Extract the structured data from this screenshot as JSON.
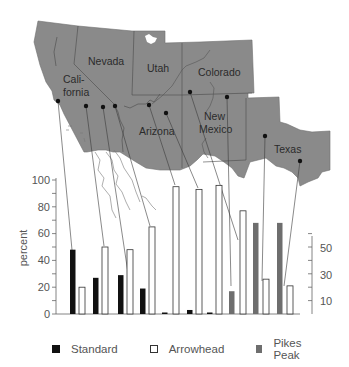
{
  "map": {
    "states": [
      {
        "name": "Nevada",
        "label": "Nevada",
        "x": 99,
        "y": 65
      },
      {
        "name": "Utah",
        "label": "Utah",
        "x": 147,
        "y": 72
      },
      {
        "name": "Colorado",
        "label": "Colorado",
        "x": 198,
        "y": 76
      },
      {
        "name": "California",
        "label_line1": "Cali-",
        "label_line2": "fornia",
        "x": 64,
        "y": 83
      },
      {
        "name": "Arizona",
        "label": "Arizona",
        "x": 139,
        "y": 135
      },
      {
        "name": "New Mexico",
        "label_line1": "New",
        "label_line2": "Mexico",
        "x": 199,
        "y": 119
      },
      {
        "name": "Texas",
        "label": "Texas",
        "x": 274,
        "y": 153
      }
    ],
    "colors": {
      "land": "#8a8a8a",
      "border": "#4a4a4a"
    }
  },
  "chart_data": {
    "type": "bar",
    "title": "",
    "xlabel": "",
    "ylabel": "percent",
    "ylim": [
      0,
      100
    ],
    "yticks_left": [
      0,
      20,
      40,
      60,
      80,
      100
    ],
    "yticks_right_labels": [
      10,
      30,
      50
    ],
    "right_axis_range": [
      0,
      60
    ],
    "grid": false,
    "legend_position": "bottom",
    "categories": [
      "Site 1 (CA coast)",
      "Site 2 (CA)",
      "Site 3 (CA)",
      "Site 4 (CA/NV)",
      "Site 5 (AZ)",
      "Site 6 (AZ)",
      "Site 7 (AZ/UT)",
      "Site 8 (NM)",
      "Site 9 (NM)",
      "Site 10 (TX)",
      "Site 11 (TX)"
    ],
    "series": [
      {
        "name": "Standard",
        "color": "#111111",
        "values": [
          48,
          27,
          29,
          19,
          1,
          3,
          1,
          null,
          null,
          null,
          null
        ]
      },
      {
        "name": "Arrowhead",
        "color": "#ffffff",
        "values": [
          20,
          50,
          48,
          65,
          95,
          93,
          96,
          77,
          26,
          21,
          null
        ]
      },
      {
        "name": "Pikes Peak",
        "color": "#6e6e6e",
        "values": [
          null,
          null,
          null,
          null,
          null,
          null,
          null,
          17,
          68,
          68,
          null
        ]
      }
    ],
    "bars": [
      {
        "series": "Standard",
        "x": 70,
        "value": 48
      },
      {
        "series": "Arrowhead",
        "x": 79,
        "value": 20
      },
      {
        "series": "Standard",
        "x": 93,
        "value": 27
      },
      {
        "series": "Arrowhead",
        "x": 102,
        "value": 50
      },
      {
        "series": "Standard",
        "x": 118,
        "value": 29
      },
      {
        "series": "Arrowhead",
        "x": 127,
        "value": 48
      },
      {
        "series": "Standard",
        "x": 140,
        "value": 19
      },
      {
        "series": "Arrowhead",
        "x": 149,
        "value": 65
      },
      {
        "series": "Standard",
        "x": 162,
        "value": 1
      },
      {
        "series": "Arrowhead",
        "x": 173,
        "value": 95
      },
      {
        "series": "Standard",
        "x": 187,
        "value": 3
      },
      {
        "series": "Arrowhead",
        "x": 196,
        "value": 93
      },
      {
        "series": "Standard",
        "x": 207,
        "value": 1
      },
      {
        "series": "Arrowhead",
        "x": 216,
        "value": 96
      },
      {
        "series": "Pikes Peak",
        "x": 229,
        "value": 17
      },
      {
        "series": "Arrowhead",
        "x": 240,
        "value": 77
      },
      {
        "series": "Pikes Peak",
        "x": 253,
        "value": 68
      },
      {
        "series": "Arrowhead",
        "x": 263,
        "value": 26
      },
      {
        "series": "Pikes Peak",
        "x": 277,
        "value": 68
      },
      {
        "series": "Arrowhead",
        "x": 287,
        "value": 21
      }
    ],
    "sites": [
      {
        "dot": [
          58,
          101
        ],
        "bar_x": 72
      },
      {
        "dot": [
          86,
          106
        ],
        "bar_x": 95
      },
      {
        "dot": [
          103,
          107
        ],
        "bar_x": 104
      },
      {
        "dot": [
          115,
          106
        ],
        "bar_x": 129
      },
      {
        "dot": [
          149,
          105
        ],
        "bar_x": 151
      },
      {
        "dot": [
          166,
          113
        ],
        "bar_x": 175
      },
      {
        "dot": [
          190,
          92
        ],
        "bar_x": 218
      },
      {
        "dot": [
          227,
          97
        ],
        "bar_x": 231
      },
      {
        "dot": [
          265,
          136
        ],
        "bar_x": 255
      },
      {
        "dot": [
          300,
          161
        ],
        "bar_x": 289
      }
    ]
  },
  "legend": {
    "items": [
      {
        "label": "Standard",
        "color": "#111111"
      },
      {
        "label": "Arrowhead",
        "color": "#ffffff"
      },
      {
        "label": "Pikes Peak",
        "color": "#6e6e6e"
      }
    ]
  },
  "axis": {
    "left_labels": [
      "0",
      "20",
      "40",
      "60",
      "80",
      "100"
    ],
    "right_labels": [
      "10",
      "30",
      "50"
    ],
    "ylabel": "percent"
  }
}
